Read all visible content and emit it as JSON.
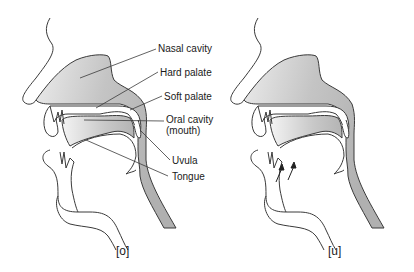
{
  "diagrams": [
    {
      "id": "o",
      "caption": "[o]",
      "labels": {
        "nasal_cavity": "Nasal cavity",
        "hard_palate": "Hard palate",
        "soft_palate": "Soft palate",
        "oral_cavity": "Oral cavity",
        "oral_cavity_sub": "(mouth)",
        "uvula": "Uvula",
        "tongue": "Tongue"
      }
    },
    {
      "id": "u",
      "caption": "[u]",
      "annotations": [
        "tongue-raise-arrow",
        "tongue-raise-arrow"
      ]
    }
  ],
  "colors": {
    "cavity_fill": "#b8b8b8",
    "cavity_fill_light": "#e6e6e6",
    "outline": "#3a3a3a",
    "background": "#ffffff"
  }
}
